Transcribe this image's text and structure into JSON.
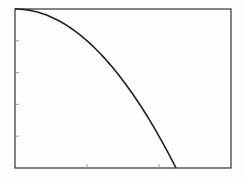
{
  "chart_data": {
    "type": "line",
    "title": "",
    "xlabel": "",
    "ylabel": "",
    "xlim": [
      0,
      3
    ],
    "ylim": [
      0,
      5
    ],
    "x_ticks": [
      0,
      1,
      2,
      3
    ],
    "y_ticks": [
      0,
      1,
      2,
      3,
      4,
      5
    ],
    "tick_labels_visible": false,
    "grid": false,
    "legend": null,
    "series": [
      {
        "name": "y = 5 - x^2",
        "color": "#222222",
        "x": [
          0,
          0.25,
          0.5,
          0.75,
          1.0,
          1.25,
          1.5,
          1.75,
          2.0,
          2.236
        ],
        "y": [
          5.0,
          4.94,
          4.75,
          4.44,
          4.0,
          3.44,
          2.75,
          1.94,
          1.0,
          0.0
        ]
      }
    ]
  },
  "colors": {
    "background": "#fdfdfd",
    "axis": "#333333",
    "line": "#222222"
  }
}
